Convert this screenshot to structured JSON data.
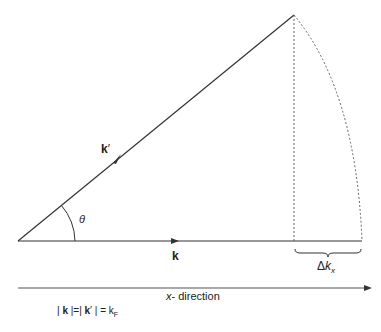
{
  "diagram": {
    "vectors": {
      "k_prime_label": "k",
      "k_prime_mark": "′",
      "k_label": "k"
    },
    "angle_label": "θ",
    "delta": {
      "symbol": "Δ",
      "var": "k",
      "sub": "x"
    },
    "axis": {
      "var": "x",
      "label": "- direction"
    },
    "equation": {
      "part1": "| ",
      "k1": "k",
      "part2": " |=| ",
      "k2": "k",
      "prime": "′",
      "part3": " |  =  ",
      "kf": "k",
      "kf_sub": "F"
    },
    "colors": {
      "line": "#333333",
      "dashed": "#666666",
      "background": "#ffffff"
    }
  }
}
